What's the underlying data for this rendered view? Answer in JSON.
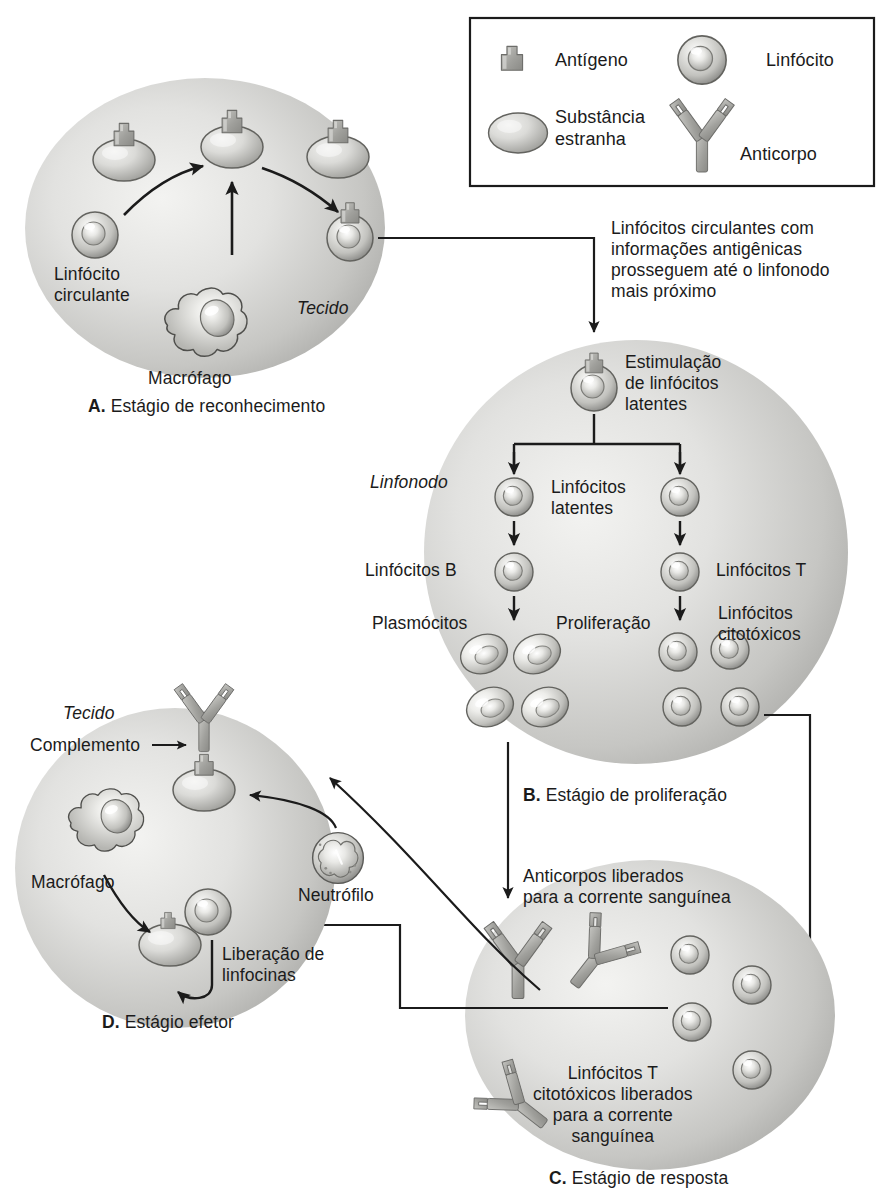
{
  "figure": {
    "language": "pt-BR",
    "panels": [
      "A",
      "B",
      "C",
      "D"
    ]
  },
  "legend": {
    "name": "legend-box",
    "items": [
      {
        "icon": "antigen-icon",
        "label": "Antígeno"
      },
      {
        "icon": "lymphocyte-icon",
        "label": "Linfócito"
      },
      {
        "icon": "foreign-substance-icon",
        "label": "Substância\nestranha"
      },
      {
        "icon": "antibody-icon",
        "label": "Anticorpo"
      }
    ]
  },
  "panel_a": {
    "caption_letter": "A.",
    "caption_text": " Estágio de reconhecimento",
    "labels": {
      "circulating_lymphocyte": "Linfócito\ncirculante",
      "macrophage": "Macrófago",
      "tissue": "Tecido"
    },
    "antigen_bodies": 3,
    "lymphocytes": 2
  },
  "connector_ab": {
    "text": "Linfócitos circulantes com\ninformações antigênicas\nprosseguem até o linfonodo\nmais próximo"
  },
  "panel_b": {
    "caption_letter": "B.",
    "caption_text": " Estágio de proliferação",
    "labels": {
      "stimulation": "Estimulação\nde linfócitos\nlatentes",
      "lymph_node": "Linfonodo",
      "dormant_lymphocytes": "Linfócitos\nlatentes",
      "b_lymphocytes": "Linfócitos B",
      "t_lymphocytes": "Linfócitos T",
      "plasma_cells": "Plasmócitos",
      "proliferation": "Proliferação",
      "cytotoxic_lymphocytes": "Linfócitos\ncitotóxicos"
    },
    "plasma_cell_count": 4,
    "cytotoxic_cell_count": 4
  },
  "panel_c": {
    "caption_letter": "C.",
    "caption_text": " Estágio de resposta",
    "labels": {
      "antibodies_released": "Anticorpos liberados\npara a corrente sanguínea",
      "cytotoxic_released": "Linfócitos T\ncitotóxicos liberados\npara a corrente\nsanguínea"
    },
    "antibody_count": 3,
    "lymphocyte_count": 4
  },
  "panel_d": {
    "caption_letter": "D.",
    "caption_text": " Estágio efetor",
    "labels": {
      "tissue": "Tecido",
      "complement": "Complemento",
      "macrophage": "Macrófago",
      "neutrophil": "Neutrófilo",
      "lymphokine_release": "Liberação de\nlinfocinas"
    }
  },
  "colors": {
    "ink": "#1b1b1b",
    "cell_fill_light": "#e8e8e6",
    "cell_fill_mid": "#c9c9c6",
    "cell_fill_dark": "#9a9a97",
    "body_fill": "#cfcfcc",
    "protein_fill": "#a8a8a4",
    "outline": "#5a5a58",
    "paper": "#ffffff"
  }
}
